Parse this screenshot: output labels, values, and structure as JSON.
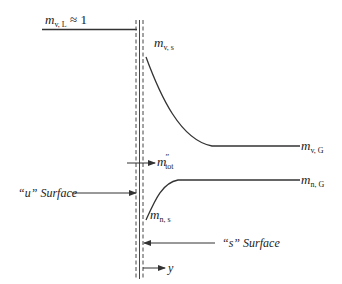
{
  "diagram": {
    "liquid_label": {
      "base": "m",
      "sub": "v, L",
      "suffix": " ≈ 1"
    },
    "vapor_surface_label": {
      "base": "m",
      "sub": "v, s"
    },
    "vapor_gas_label": {
      "base": "m",
      "sub": "v, G"
    },
    "flux_label": {
      "base": "m",
      "sup": "″",
      "sub": "tot"
    },
    "inert_gas_label": {
      "base": "m",
      "sub": "n, G"
    },
    "inert_surface_label": {
      "base": "m",
      "sub": "n, s"
    },
    "u_surface_label": {
      "quote_open": "“",
      "letter": "u",
      "quote_close": "”",
      "word": " Surface"
    },
    "s_surface_label": {
      "quote_open": "“",
      "letter": "s",
      "quote_close": "”",
      "word": " Surface"
    },
    "axis_label": "y",
    "colors": {
      "line": "#333333",
      "background": "#ffffff"
    }
  }
}
